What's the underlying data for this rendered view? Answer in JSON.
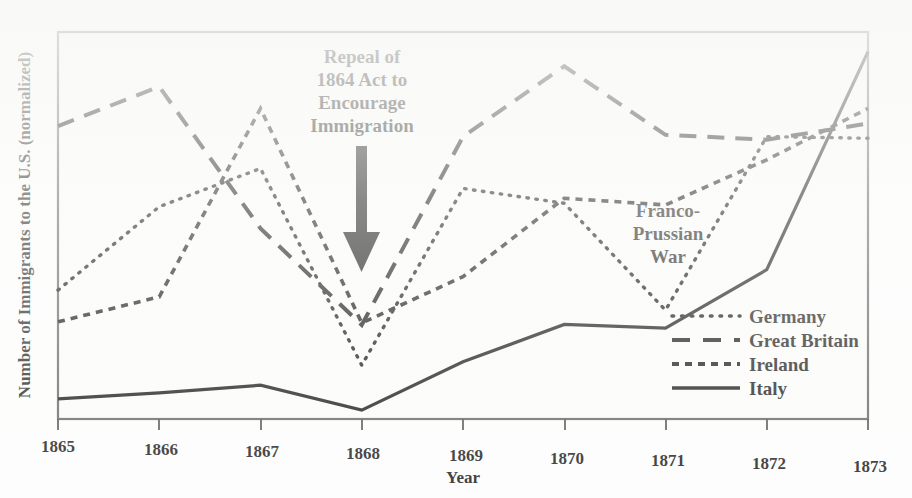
{
  "chart_data": {
    "type": "line",
    "title": "",
    "xlabel": "Year",
    "ylabel": "Number of Immigrants to the U.S. (normalized)",
    "categories": [
      "1865",
      "1866",
      "1867",
      "1868",
      "1869",
      "1870",
      "1871",
      "1872",
      "1873"
    ],
    "x": [
      1865,
      1866,
      1867,
      1868,
      1869,
      1870,
      1871,
      1872,
      1873
    ],
    "xlim": [
      1865,
      1873
    ],
    "ylim": [
      0,
      1
    ],
    "grid": false,
    "y_axis_ticks_shown": false,
    "legend_position": "bottom-right",
    "series": [
      {
        "name": "Germany",
        "style": "dotted",
        "color": "#000000",
        "values": [
          0.333,
          0.553,
          0.656,
          0.152,
          0.613,
          0.579,
          0.307,
          0.76,
          0.76
        ]
      },
      {
        "name": "Great Britain",
        "style": "long-dashed",
        "color": "#000000",
        "values": [
          0.757,
          0.863,
          0.501,
          0.256,
          0.747,
          0.933,
          0.76,
          0.752,
          0.798
        ]
      },
      {
        "name": "Ireland",
        "style": "short-dashed",
        "color": "#000000",
        "values": [
          0.251,
          0.32,
          0.811,
          0.261,
          0.385,
          0.592,
          0.579,
          0.7,
          0.837
        ]
      },
      {
        "name": "Italy",
        "style": "solid",
        "color": "#000000",
        "values": [
          0.052,
          0.072,
          0.096,
          0.036,
          0.165,
          0.266,
          0.261,
          0.416,
          0.984
        ]
      }
    ],
    "annotations": [
      {
        "id": "repeal-1864-act",
        "text_lines": [
          "Repeal of",
          "1864 Act to",
          "Encourage",
          "Immigration"
        ],
        "points_at_year": 1868,
        "has_arrow": true
      },
      {
        "id": "franco-prussian-war",
        "text_lines": [
          "Franco-",
          "Prussian",
          "War"
        ],
        "points_at_year": 1871,
        "has_arrow": false
      }
    ]
  },
  "axes": {
    "x_title": "Year",
    "y_title": "Number of Immigrants to the U.S. (normalized)",
    "x_tick_labels": [
      "1865",
      "1866",
      "1867",
      "1868",
      "1869",
      "1870",
      "1871",
      "1872",
      "1873"
    ]
  },
  "annotations": {
    "repeal": {
      "line1": "Repeal of",
      "line2": "1864 Act to",
      "line3": "Encourage",
      "line4": "Immigration"
    },
    "franco_prussian": {
      "line1": "Franco-",
      "line2": "Prussian",
      "line3": "War"
    }
  },
  "legend": {
    "items": [
      {
        "label": "Germany",
        "style": "dotted"
      },
      {
        "label": "Great Britain",
        "style": "long-dashed"
      },
      {
        "label": "Ireland",
        "style": "short-dashed"
      },
      {
        "label": "Italy",
        "style": "solid"
      }
    ]
  },
  "colors": {
    "ink": "#000000",
    "frame": "#555555",
    "paper": "#fbfbf9"
  }
}
